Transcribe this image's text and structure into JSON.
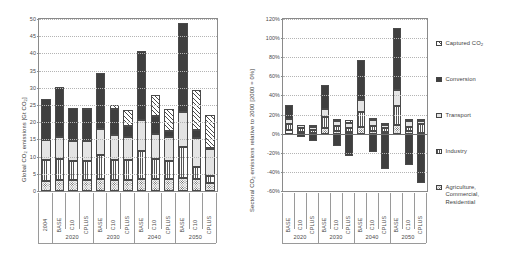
{
  "figure": {
    "background": "#ffffff",
    "ink": "#3f3f3f"
  },
  "legend": {
    "position": "right",
    "items": [
      {
        "key": "captured",
        "label": "Captured CO",
        "sub": "2",
        "pattern": "diagonal-hatch",
        "color": "#ffffff"
      },
      {
        "key": "conversion",
        "label": "Conversion",
        "sub": "",
        "pattern": "solid-dark",
        "color": "#3f3f3f"
      },
      {
        "key": "transport",
        "label": "Transport",
        "sub": "",
        "pattern": "light-fill",
        "color": "#e4e4e4"
      },
      {
        "key": "industry",
        "label": "Industry",
        "sub": "",
        "pattern": "vertical-lines",
        "color": "#fdfdfd"
      },
      {
        "key": "agri",
        "label": "Agriculture,",
        "label2": "Commercial,",
        "label3": "Residential",
        "sub": "",
        "pattern": "dotted",
        "color": "#fbfbfb"
      }
    ]
  },
  "chart_data": [
    {
      "id": "global-co2-emissions",
      "type": "bar",
      "stacked": true,
      "title": "",
      "ylabel": "Global CO2 emissions [Gt CO2]",
      "ylabel_parts": [
        "Global CO",
        "2",
        " emissions [Gt CO",
        "2",
        "]"
      ],
      "xlabel": "",
      "ylim": [
        0,
        50
      ],
      "yticks": [
        0,
        5,
        10,
        15,
        20,
        25,
        30,
        35,
        40,
        45,
        50
      ],
      "ytick_labels": [
        "0",
        "5",
        "10",
        "15",
        "20",
        "25",
        "30",
        "35",
        "40",
        "45",
        "50"
      ],
      "grid": true,
      "categories": [
        "2004",
        "BASE",
        "C10",
        "CPLUS",
        "BASE",
        "C10",
        "CPLUS",
        "BASE",
        "C10",
        "CPLUS",
        "BASE",
        "C10",
        "CPLUS"
      ],
      "groups": [
        {
          "label": "",
          "span": 1
        },
        {
          "label": "2020",
          "span": 3
        },
        {
          "label": "2030",
          "span": 3
        },
        {
          "label": "2040",
          "span": 3
        },
        {
          "label": "2050",
          "span": 3
        }
      ],
      "series": [
        {
          "name": "Agriculture, Commercial, Residential",
          "key": "agri",
          "values": [
            3.0,
            3.2,
            3.1,
            3.1,
            3.4,
            3.3,
            3.3,
            3.6,
            3.4,
            3.4,
            3.8,
            3.5,
            2.4
          ]
        },
        {
          "name": "Industry",
          "key": "industry",
          "values": [
            5.9,
            6.1,
            5.5,
            5.6,
            7.0,
            5.8,
            5.6,
            8.0,
            6.0,
            5.4,
            9.0,
            3.4,
            1.9
          ]
        },
        {
          "name": "Transport",
          "key": "transport",
          "values": [
            6.0,
            6.4,
            6.0,
            5.9,
            7.6,
            7.1,
            6.9,
            9.0,
            7.1,
            6.9,
            10.2,
            8.5,
            7.9
          ]
        },
        {
          "name": "Conversion",
          "key": "conversion",
          "values": [
            11.7,
            14.4,
            9.6,
            9.3,
            16.4,
            7.6,
            3.2,
            20.2,
            5.2,
            1.8,
            25.8,
            2.2,
            0.3
          ]
        },
        {
          "name": "Captured CO2",
          "key": "captured",
          "values": [
            0.0,
            0.0,
            0.0,
            0.2,
            0.0,
            1.2,
            4.6,
            0.0,
            6.1,
            6.2,
            0.0,
            11.9,
            9.6
          ]
        }
      ],
      "totals": [
        26.6,
        30.1,
        24.2,
        24.1,
        34.4,
        25.0,
        23.6,
        40.8,
        27.8,
        23.7,
        48.8,
        29.5,
        22.1
      ]
    },
    {
      "id": "sectoral-co2-emissions",
      "type": "bar",
      "stacked": true,
      "title": "",
      "ylabel": "Sectoral CO2 emissions relative to 2000 [2000 = 0%]",
      "ylabel_parts": [
        "Sectoral CO",
        "2",
        " emissions relative to 2000 [2000 = 0%]"
      ],
      "xlabel": "",
      "ylim": [
        -60,
        120
      ],
      "yticks": [
        -60,
        -40,
        -20,
        0,
        20,
        40,
        60,
        80,
        100,
        120
      ],
      "ytick_labels": [
        "-60%",
        "-40%",
        "-20%",
        "0%",
        "20%",
        "40%",
        "60%",
        "80%",
        "100%",
        "120%"
      ],
      "grid": true,
      "unit": "%",
      "categories": [
        "BASE",
        "C10",
        "CPLUS",
        "BASE",
        "C10",
        "CPLUS",
        "BASE",
        "C10",
        "CPLUS",
        "BASE",
        "C10",
        "CPLUS"
      ],
      "groups": [
        {
          "label": "2020",
          "span": 3
        },
        {
          "label": "2030",
          "span": 3
        },
        {
          "label": "2040",
          "span": 3
        },
        {
          "label": "2050",
          "span": 3
        }
      ],
      "series": [
        {
          "name": "Agriculture, Commercial, Residential",
          "key": "agri",
          "values": [
            4,
            2,
            1,
            6,
            3,
            2,
            7,
            3,
            2,
            9,
            3,
            1
          ]
        },
        {
          "name": "Industry",
          "key": "industry",
          "values": [
            6,
            4,
            3,
            11,
            5,
            4,
            16,
            5,
            4,
            20,
            4,
            9
          ]
        },
        {
          "name": "Transport",
          "key": "transport",
          "values": [
            5,
            3,
            3,
            9,
            5,
            5,
            12,
            6,
            3,
            17,
            6,
            3
          ]
        },
        {
          "name": "Conversion",
          "key": "conversion",
          "values": [
            15,
            -4,
            -8,
            25,
            -13,
            -23,
            42,
            -19,
            -37,
            65,
            -33,
            -52
          ]
        },
        {
          "name": "Captured CO2",
          "key": "captured",
          "values": [
            0,
            0,
            2,
            0,
            2,
            3,
            0,
            2,
            2,
            0,
            2,
            2
          ]
        }
      ],
      "positive_tops": [
        28,
        9,
        9,
        46,
        15,
        14,
        74,
        16,
        11,
        107,
        15,
        15
      ],
      "negative_bottoms": [
        0,
        -4,
        -8,
        0,
        -13,
        -23,
        0,
        -19,
        -37,
        0,
        -33,
        -52
      ]
    }
  ]
}
